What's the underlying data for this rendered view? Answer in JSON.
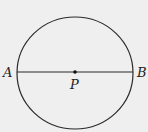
{
  "diagram": {
    "type": "geometry",
    "circle": {
      "center": {
        "x": 75,
        "y": 73
      },
      "rx": 58,
      "ry": 56,
      "stroke": "#2a2a2a"
    },
    "diameter": {
      "from": "A",
      "to": "B",
      "x1": 17,
      "y1": 72,
      "x2": 133,
      "y2": 72
    },
    "points": [
      {
        "id": "A",
        "label": "A",
        "x": 17,
        "y": 72
      },
      {
        "id": "P",
        "label": "P",
        "x": 75,
        "y": 72
      },
      {
        "id": "B",
        "label": "B",
        "x": 133,
        "y": 72
      }
    ],
    "labels": {
      "A": "A",
      "P": "P",
      "B": "B"
    },
    "colors": {
      "background": "#efefef",
      "stroke": "#2a2a2a",
      "text": "#222222"
    }
  }
}
